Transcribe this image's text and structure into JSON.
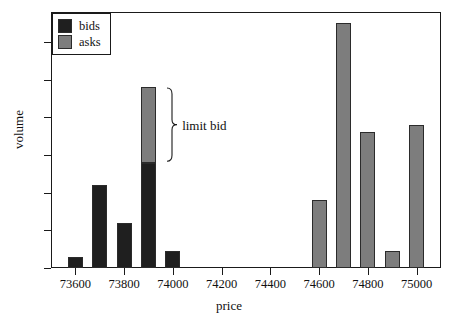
{
  "chart_data": {
    "type": "bar",
    "title": "",
    "xlabel": "price",
    "ylabel": "volume",
    "xlim": [
      73500,
      75100
    ],
    "ylim": [
      0,
      68
    ],
    "grid": false,
    "legend_position": "top-left",
    "x_ticks": [
      73600,
      73800,
      74000,
      74200,
      74400,
      74600,
      74800,
      75000
    ],
    "x_tick_labels": [
      "73600",
      "73800",
      "74000",
      "74200",
      "74400",
      "74600",
      "74800",
      "75000"
    ],
    "y_ticks": [
      0,
      10,
      20,
      30,
      40,
      50,
      60
    ],
    "y_tick_labels": [
      "0",
      "10",
      "20",
      "30",
      "40",
      "50",
      "60"
    ],
    "bar_width": 100,
    "series": [
      {
        "name": "bids",
        "color": "#1f1f1f",
        "points": [
          {
            "x": 73600,
            "value": 3
          },
          {
            "x": 73700,
            "value": 22
          },
          {
            "x": 73800,
            "value": 12
          },
          {
            "x": 73900,
            "value": 28
          },
          {
            "x": 74000,
            "value": 4.5
          }
        ]
      },
      {
        "name": "asks",
        "color": "#7d7d7d",
        "points": [
          {
            "x": 73900,
            "value": 20,
            "base": 28
          },
          {
            "x": 74600,
            "value": 18
          },
          {
            "x": 74700,
            "value": 65
          },
          {
            "x": 74800,
            "value": 36
          },
          {
            "x": 74900,
            "value": 4.5
          },
          {
            "x": 75000,
            "value": 38
          }
        ]
      }
    ],
    "annotations": [
      {
        "text": "limit bid",
        "kind": "brace",
        "x": 73960,
        "y_from": 28,
        "y_to": 48
      }
    ]
  },
  "legend": {
    "items": [
      {
        "label": "bids",
        "color": "#1f1f1f"
      },
      {
        "label": "asks",
        "color": "#7d7d7d"
      }
    ]
  },
  "axes": {
    "x_title": "price",
    "y_title": "volume"
  },
  "annotation": {
    "label": "limit bid"
  }
}
